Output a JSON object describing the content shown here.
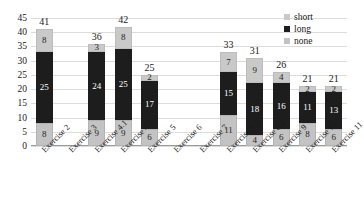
{
  "chart_data": {
    "type": "bar",
    "subtype": "stacked-bar",
    "title": "",
    "xlabel": "",
    "ylabel": "",
    "ylim": [
      0,
      45
    ],
    "ytick_step": 5,
    "yticks": [
      0,
      5,
      10,
      15,
      20,
      25,
      30,
      35,
      40,
      45
    ],
    "grid": true,
    "legend_position": "top-right",
    "categories": [
      "Exercise 2",
      "Exercise 3",
      "Exercise 4.1",
      "Exercise 4.2",
      "Exercise 5",
      "Exercise 6",
      "Exercise 7",
      "Exercise 8.1",
      "Exercise 8.2",
      "Exercise 9",
      "Exercise 10",
      "Exercise 11"
    ],
    "stack_order_bottom_to_top": [
      "none",
      "long",
      "short"
    ],
    "series": [
      {
        "name": "none",
        "color": "#c3c3c3",
        "values": [
          8,
          null,
          9,
          9,
          6,
          null,
          null,
          11,
          4,
          6,
          8,
          6
        ]
      },
      {
        "name": "long",
        "color": "#1d1d1d",
        "values": [
          25,
          null,
          24,
          25,
          17,
          null,
          null,
          15,
          18,
          16,
          11,
          13
        ]
      },
      {
        "name": "short",
        "color": "#c9c9c9",
        "values": [
          8,
          null,
          3,
          8,
          2,
          null,
          null,
          7,
          9,
          4,
          2,
          2
        ]
      }
    ],
    "totals": [
      41,
      null,
      36,
      42,
      25,
      null,
      null,
      33,
      31,
      26,
      21,
      21
    ]
  },
  "legend": {
    "items": [
      {
        "label": "short",
        "color": "#c9c9c9"
      },
      {
        "label": "long",
        "color": "#1d1d1d"
      },
      {
        "label": "none",
        "color": "#c3c3c3"
      }
    ]
  }
}
